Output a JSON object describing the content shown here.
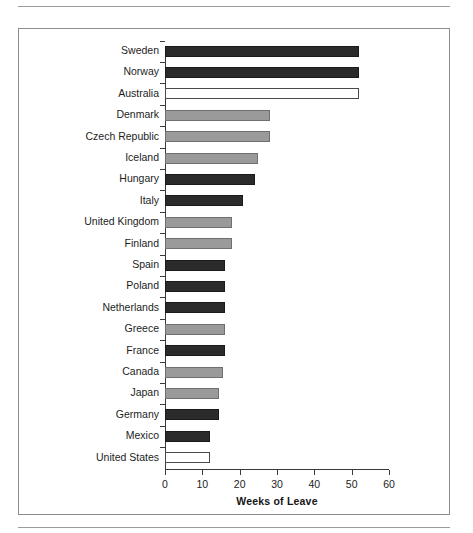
{
  "page": {
    "background_color": "#ffffff",
    "frame_border_color": "#8d8d8d",
    "rule_color": "#9b9b9b"
  },
  "chart_data": {
    "type": "bar",
    "orientation": "horizontal",
    "title": "",
    "subtitle": "",
    "xlabel": "Weeks of Leave",
    "ylabel": "",
    "xlim": [
      0,
      60
    ],
    "ylim": null,
    "grid": false,
    "legend": null,
    "x_ticks": [
      0,
      10,
      20,
      30,
      40,
      50,
      60
    ],
    "x_tick_labels": [
      "0",
      "10",
      "20",
      "30",
      "40",
      "50",
      "60"
    ],
    "categories": [
      "Sweden",
      "Norway",
      "Australia",
      "Denmark",
      "Czech Republic",
      "Iceland",
      "Hungary",
      "Italy",
      "United Kingdom",
      "Finland",
      "Spain",
      "Poland",
      "Netherlands",
      "Greece",
      "France",
      "Canada",
      "Japan",
      "Germany",
      "Mexico",
      "United States"
    ],
    "values": [
      52,
      52,
      52,
      28,
      28,
      25,
      24,
      21,
      18,
      18,
      16,
      16,
      16,
      16,
      16,
      15.5,
      14.5,
      14.5,
      12,
      12
    ],
    "bar_colors": [
      "#2b2b2b",
      "#2b2b2b",
      "#ffffff",
      "#9a9a9a",
      "#9a9a9a",
      "#9a9a9a",
      "#2b2b2b",
      "#2b2b2b",
      "#9a9a9a",
      "#9a9a9a",
      "#2b2b2b",
      "#2b2b2b",
      "#2b2b2b",
      "#9a9a9a",
      "#2b2b2b",
      "#9a9a9a",
      "#9a9a9a",
      "#2b2b2b",
      "#2b2b2b",
      "#ffffff"
    ],
    "bar_styles": [
      "dark",
      "dark",
      "white",
      "gray",
      "gray",
      "gray",
      "dark",
      "dark",
      "gray",
      "gray",
      "dark",
      "dark",
      "dark",
      "gray",
      "dark",
      "gray",
      "gray",
      "dark",
      "dark",
      "white"
    ],
    "palette": {
      "dark": "#2b2b2b",
      "gray": "#9a9a9a",
      "white": "#ffffff",
      "axis": "#3a3a3a",
      "text": "#1d1d1d"
    }
  }
}
